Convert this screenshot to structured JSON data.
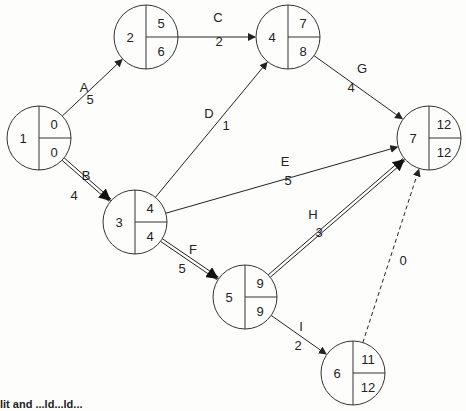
{
  "diagram": {
    "type": "activity-on-arrow network (CPM)",
    "nodes": [
      {
        "id": "1",
        "cx": 39,
        "cy": 138,
        "top": "0",
        "bottom": "0"
      },
      {
        "id": "2",
        "cx": 146,
        "cy": 37,
        "top": "5",
        "bottom": "6"
      },
      {
        "id": "4",
        "cx": 288,
        "cy": 37,
        "top": "7",
        "bottom": "8"
      },
      {
        "id": "3",
        "cx": 135,
        "cy": 222,
        "top": "4",
        "bottom": "4"
      },
      {
        "id": "5",
        "cx": 245,
        "cy": 297,
        "top": "9",
        "bottom": "9"
      },
      {
        "id": "7",
        "cx": 429,
        "cy": 138,
        "top": "12",
        "bottom": "12"
      },
      {
        "id": "6",
        "cx": 353,
        "cy": 373,
        "top": "11",
        "bottom": "12"
      }
    ],
    "activities": [
      {
        "name": "A",
        "from": "1",
        "to": "2",
        "duration": "5",
        "style": "normal"
      },
      {
        "name": "B",
        "from": "1",
        "to": "3",
        "duration": "4",
        "style": "critical"
      },
      {
        "name": "C",
        "from": "2",
        "to": "4",
        "duration": "2",
        "style": "normal"
      },
      {
        "name": "D",
        "from": "3",
        "to": "4",
        "duration": "1",
        "style": "normal"
      },
      {
        "name": "E",
        "from": "3",
        "to": "7",
        "duration": "5",
        "style": "normal"
      },
      {
        "name": "F",
        "from": "3",
        "to": "5",
        "duration": "5",
        "style": "critical"
      },
      {
        "name": "G",
        "from": "4",
        "to": "7",
        "duration": "4",
        "style": "normal"
      },
      {
        "name": "H",
        "from": "5",
        "to": "7",
        "duration": "3",
        "style": "critical"
      },
      {
        "name": "I",
        "from": "5",
        "to": "6",
        "duration": "2",
        "style": "normal"
      },
      {
        "name": "",
        "from": "6",
        "to": "7",
        "duration": "0",
        "style": "dummy"
      }
    ]
  },
  "caption": "lit and ...ld...ld..."
}
